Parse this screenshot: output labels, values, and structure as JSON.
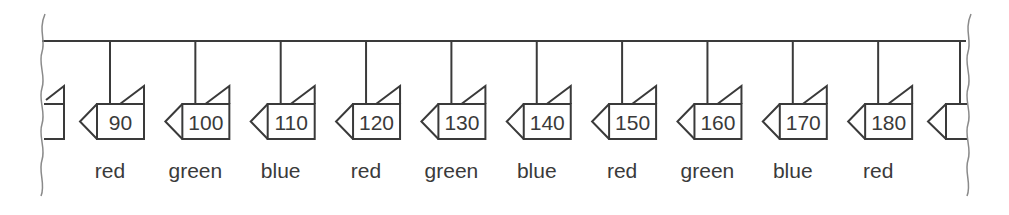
{
  "diagram": {
    "colors": {
      "stroke": "#3a3a3a",
      "break": "#8a8a8a",
      "background": "#ffffff"
    },
    "nodes": [
      {
        "value": "90",
        "label": "red"
      },
      {
        "value": "100",
        "label": "green"
      },
      {
        "value": "110",
        "label": "blue"
      },
      {
        "value": "120",
        "label": "red"
      },
      {
        "value": "130",
        "label": "green"
      },
      {
        "value": "140",
        "label": "blue"
      },
      {
        "value": "150",
        "label": "red"
      },
      {
        "value": "160",
        "label": "green"
      },
      {
        "value": "170",
        "label": "blue"
      },
      {
        "value": "180",
        "label": "red"
      }
    ]
  }
}
